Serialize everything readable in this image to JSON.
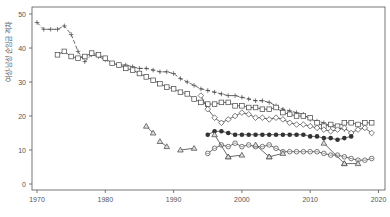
{
  "chart_data": {
    "type": "line",
    "title": "",
    "xlabel": "",
    "ylabel": "여성-남성 순임금 격차",
    "xlim": [
      1969,
      2021
    ],
    "ylim": [
      -2,
      52
    ],
    "xticks": [
      1970,
      1980,
      1990,
      2000,
      2010,
      2020
    ],
    "yticks": [
      0,
      10,
      20,
      30,
      40,
      50
    ],
    "grid": false,
    "legend": null,
    "series": [
      {
        "name": "plus-dashed",
        "marker": "plus",
        "line": "dashed",
        "x": [
          1970,
          1971,
          1972,
          1973,
          1974,
          1975,
          1976,
          1977,
          1978,
          1979,
          1980,
          1981,
          1982,
          1983,
          1984,
          1985,
          1986,
          1987,
          1988,
          1989,
          1990,
          1991,
          1992,
          1993,
          1994,
          1995,
          1996,
          1997,
          1998,
          1999,
          2000,
          2001,
          2002,
          2003,
          2004,
          2005,
          2006,
          2007,
          2008,
          2009,
          2010,
          2011,
          2012,
          2013,
          2014,
          2015
        ],
        "y": [
          47.5,
          45.5,
          45.5,
          45.5,
          46.5,
          44,
          39,
          36,
          38,
          37.5,
          36.5,
          35.5,
          35,
          35,
          34.5,
          34,
          34,
          33.5,
          33,
          33,
          32.5,
          31,
          30,
          29,
          28,
          27.5,
          27,
          26.5,
          26,
          26,
          25.5,
          25,
          24.5,
          24.5,
          24,
          23,
          22,
          21.5,
          21,
          20.5,
          19,
          18.5,
          18,
          17,
          16.5,
          16
        ]
      },
      {
        "name": "square",
        "marker": "square",
        "line": "solid",
        "x": [
          1973,
          1974,
          1975,
          1976,
          1977,
          1978,
          1979,
          1980,
          1981,
          1982,
          1983,
          1984,
          1985,
          1986,
          1987,
          1988,
          1989,
          1990,
          1991,
          1992,
          1993,
          1994,
          1995,
          1996,
          1997,
          1998,
          1999,
          2000,
          2001,
          2002,
          2003,
          2004,
          2005,
          2006,
          2007,
          2008,
          2009,
          2010,
          2011,
          2012,
          2013,
          2014,
          2015,
          2016,
          2017,
          2018,
          2019
        ],
        "y": [
          38,
          39,
          37.5,
          37,
          37.5,
          38.5,
          38,
          37,
          35.5,
          35,
          34,
          33.5,
          32.5,
          31.5,
          30.5,
          29.5,
          28.5,
          28,
          27,
          26.5,
          25,
          24,
          23.5,
          23.5,
          24,
          24,
          23,
          23,
          22.5,
          22.5,
          22,
          22,
          22.5,
          21,
          20.5,
          20,
          20,
          19.5,
          18,
          17,
          17.5,
          17,
          18,
          18,
          17.5,
          18,
          18
        ]
      },
      {
        "name": "diamond",
        "marker": "diamond",
        "line": "solid",
        "x": [
          1994,
          1995,
          1996,
          1997,
          1998,
          1999,
          2000,
          2001,
          2002,
          2003,
          2004,
          2005,
          2006,
          2007,
          2008,
          2009,
          2010,
          2011,
          2012,
          2013,
          2014,
          2015,
          2016,
          2017,
          2018,
          2019
        ],
        "y": [
          26,
          22,
          19.5,
          18,
          19,
          20,
          21,
          20.5,
          19.5,
          19.5,
          19,
          19.5,
          19,
          18,
          17.5,
          17.5,
          17,
          16.5,
          16,
          15.5,
          16,
          16.5,
          15,
          16,
          16.5,
          15
        ]
      },
      {
        "name": "filled-circle",
        "marker": "filled-circle",
        "line": "solid",
        "x": [
          1995,
          1996,
          1997,
          1998,
          1999,
          2000,
          2001,
          2002,
          2003,
          2004,
          2005,
          2006,
          2007,
          2008,
          2009,
          2010,
          2011,
          2012,
          2013,
          2014,
          2015,
          2016
        ],
        "y": [
          14.5,
          15.5,
          15.5,
          15,
          14.5,
          14.5,
          14.5,
          14.5,
          14.5,
          14.5,
          14.5,
          14.5,
          14.5,
          14.5,
          14.5,
          14,
          14,
          13.5,
          13.5,
          13,
          13.5,
          14
        ]
      },
      {
        "name": "open-circle",
        "marker": "open-circle",
        "line": "solid",
        "x": [
          1995,
          1996,
          1997,
          1998,
          1999,
          2000,
          2001,
          2002,
          2003,
          2004,
          2005,
          2006,
          2007,
          2008,
          2009,
          2010,
          2011,
          2012,
          2013,
          2014,
          2015,
          2016,
          2017,
          2018,
          2019
        ],
        "y": [
          9,
          10.5,
          11.5,
          11,
          12,
          11,
          11.5,
          11,
          11,
          11.5,
          10.5,
          9.5,
          9.5,
          9.5,
          9.5,
          9.5,
          9.5,
          9,
          8.5,
          8.5,
          8,
          7.5,
          7,
          7,
          7.5
        ]
      },
      {
        "name": "triangle",
        "marker": "triangle",
        "line": "solid",
        "segments": [
          {
            "x": [
              1986,
              1987
            ],
            "y": [
              17,
              15
            ]
          },
          {
            "x": [
              1988,
              1989
            ],
            "y": [
              12.5,
              11
            ]
          },
          {
            "x": [
              1991,
              1993
            ],
            "y": [
              10,
              10.5
            ]
          },
          {
            "x": [
              1996,
              1998
            ],
            "y": [
              14.5,
              8
            ]
          },
          {
            "x": [
              1998,
              2000
            ],
            "y": [
              8,
              8.5
            ]
          },
          {
            "x": [
              2002,
              2004
            ],
            "y": [
              11.5,
              8
            ]
          },
          {
            "x": [
              2004,
              2006
            ],
            "y": [
              8,
              9
            ]
          },
          {
            "x": [
              2012,
              2015
            ],
            "y": [
              12,
              6
            ]
          },
          {
            "x": [
              2015,
              2017
            ],
            "y": [
              6,
              6
            ]
          }
        ]
      }
    ]
  }
}
